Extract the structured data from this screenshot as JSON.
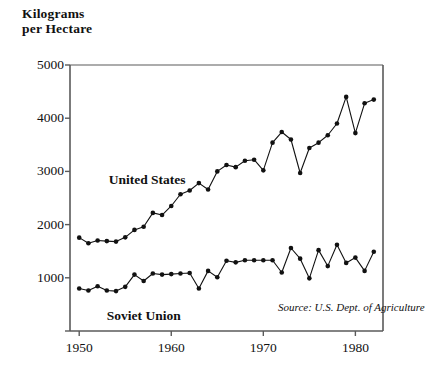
{
  "chart_data": {
    "type": "line",
    "title_line1": "Kilograms",
    "title_line2": "per Hectare",
    "xlabel": "",
    "ylabel": "Kilograms per Hectare",
    "xlim": [
      1949,
      1983
    ],
    "ylim": [
      0,
      5000
    ],
    "grid": false,
    "legend_position": "inline-annotation",
    "yticks": [
      0,
      1000,
      2000,
      3000,
      4000,
      5000
    ],
    "ytick_labels": [
      "",
      "1000",
      "2000",
      "3000",
      "4000",
      "5000"
    ],
    "xticks": [
      1950,
      1960,
      1970,
      1980
    ],
    "xtick_labels": [
      "1950",
      "1960",
      "1970",
      "1980"
    ],
    "x": [
      1950,
      1951,
      1952,
      1953,
      1954,
      1955,
      1956,
      1957,
      1958,
      1959,
      1960,
      1961,
      1962,
      1963,
      1964,
      1965,
      1966,
      1967,
      1968,
      1969,
      1970,
      1971,
      1972,
      1973,
      1974,
      1975,
      1976,
      1977,
      1978,
      1979,
      1980,
      1981,
      1982
    ],
    "series": [
      {
        "name": "United States",
        "values": [
          1755,
          1650,
          1700,
          1690,
          1680,
          1760,
          1900,
          1960,
          2220,
          2180,
          2350,
          2570,
          2640,
          2780,
          2660,
          3000,
          3120,
          3080,
          3200,
          3220,
          3020,
          3540,
          3740,
          3600,
          2970,
          3440,
          3540,
          3680,
          3900,
          4400,
          3720,
          4280,
          4350
        ]
      },
      {
        "name": "Soviet Union",
        "values": [
          800,
          760,
          840,
          760,
          750,
          830,
          1060,
          940,
          1080,
          1060,
          1070,
          1080,
          1090,
          800,
          1130,
          1010,
          1320,
          1290,
          1330,
          1330,
          1330,
          1330,
          1100,
          1560,
          1360,
          990,
          1520,
          1220,
          1620,
          1280,
          1380,
          1130,
          1490
        ]
      }
    ],
    "annotations": [
      {
        "name": "united-states-label",
        "text": "United States",
        "x": 1953.2,
        "y": 2980
      },
      {
        "name": "soviet-union-label",
        "text": "Soviet Union",
        "x": 1953.0,
        "y": 430
      },
      {
        "name": "source-note",
        "text": "Source: U.S. Dept. of Agriculture",
        "x": 1971.6,
        "y": 560
      }
    ],
    "marker": "filled-circle",
    "line_color": "#111111",
    "marker_color": "#111111",
    "background": "#ffffff",
    "axis_color": "#5a5a5a"
  }
}
